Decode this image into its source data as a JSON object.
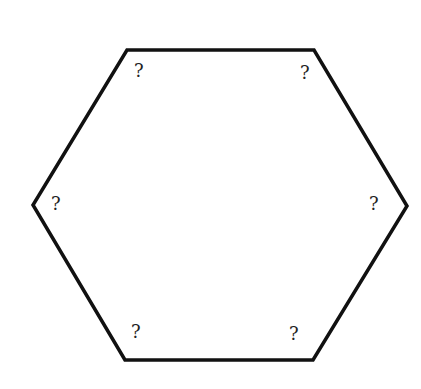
{
  "diagram": {
    "shape": "hexagon",
    "stroke_color": "#111111",
    "vertices": [
      {
        "x": 127,
        "y": 50
      },
      {
        "x": 314,
        "y": 50
      },
      {
        "x": 407,
        "y": 206
      },
      {
        "x": 313,
        "y": 360
      },
      {
        "x": 125,
        "y": 360
      },
      {
        "x": 33,
        "y": 205
      }
    ],
    "labels": [
      {
        "text": "?",
        "position": "top-left"
      },
      {
        "text": "?",
        "position": "top-right"
      },
      {
        "text": "?",
        "position": "right"
      },
      {
        "text": "?",
        "position": "bottom-right"
      },
      {
        "text": "?",
        "position": "bottom-left"
      },
      {
        "text": "?",
        "position": "left"
      }
    ]
  }
}
